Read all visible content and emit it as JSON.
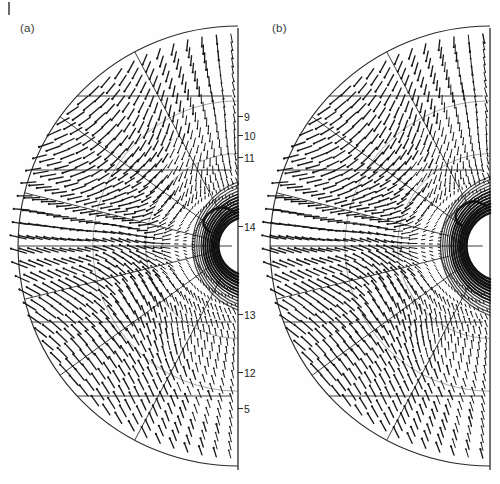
{
  "figure": {
    "type": "vector-field-figure",
    "background": "#fefefe",
    "ink_color": "#1a1a1a",
    "corner_tick": "|"
  },
  "panels": [
    {
      "id": "a",
      "label": "(a)",
      "label_x": 20,
      "label_y": 22,
      "axis_x": 238,
      "axis_top": 28,
      "axis_bottom": 470,
      "center_x": 238,
      "center_y": 246,
      "outer_radius": 220,
      "inner_radius": 30,
      "n_rays": 46,
      "n_rings": 22,
      "tick_labels": [
        {
          "text": "9",
          "y": 112
        },
        {
          "text": "10",
          "y": 131
        },
        {
          "text": "11",
          "y": 153
        },
        {
          "text": "14",
          "y": 222
        },
        {
          "text": "13",
          "y": 310
        },
        {
          "text": "12",
          "y": 368
        },
        {
          "text": "5",
          "y": 404
        }
      ],
      "block_boundary_angles": [
        -62,
        -36,
        -14,
        14,
        36,
        62
      ]
    },
    {
      "id": "b",
      "label": "(b)",
      "label_x": 272,
      "label_y": 22,
      "axis_x": 490,
      "axis_top": 28,
      "axis_bottom": 470,
      "center_x": 490,
      "center_y": 246,
      "outer_radius": 220,
      "inner_radius": 36,
      "n_rays": 46,
      "n_rings": 22,
      "tick_labels": [],
      "block_boundary_angles": [
        -62,
        -36,
        -14,
        14,
        36,
        62
      ]
    }
  ],
  "chart_data": {
    "type": "scatter",
    "title": "",
    "subtitle": "",
    "xlabel": "",
    "ylabel": "",
    "grid": true,
    "legend": null,
    "panel_labels": [
      "(a)",
      "(b)"
    ],
    "tick_labels_panel_a": [
      "9",
      "10",
      "11",
      "14",
      "13",
      "12",
      "5"
    ],
    "tick_labels_panel_b": []
  }
}
